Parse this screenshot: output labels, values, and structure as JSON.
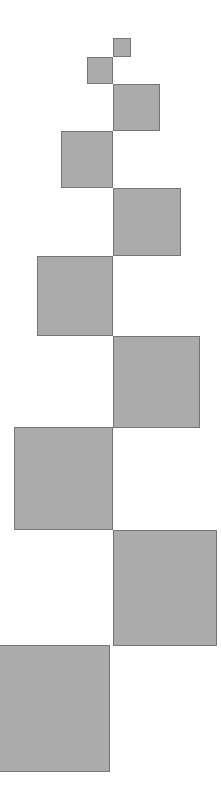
{
  "figure": {
    "canvas_width": 221,
    "canvas_height": 806,
    "background_color": "#ffffff",
    "fill_color": "#ababab",
    "stroke_color": "#757575",
    "stroke_width": 1
  },
  "chart_data": {
    "type": "diagram",
    "xlabel": "",
    "ylabel": "",
    "grid": false,
    "legend": null,
    "xlim": [
      0,
      221
    ],
    "ylim": [
      0,
      806
    ],
    "units": "pixels",
    "fill_color": "#ababab",
    "stroke_color": "#757575",
    "squares": [
      {
        "index": 1,
        "side": 18,
        "x": 113,
        "y": 38,
        "width": 18,
        "height": 19,
        "side_label": "1",
        "align": "right",
        "clipped": false
      },
      {
        "index": 2,
        "side": 27,
        "x": 87,
        "y": 57,
        "width": 26,
        "height": 27,
        "side_label": "2",
        "align": "left",
        "clipped": false
      },
      {
        "index": 3,
        "side": 46,
        "x": 113,
        "y": 84,
        "width": 47,
        "height": 47,
        "side_label": "3",
        "align": "right",
        "clipped": false
      },
      {
        "index": 4,
        "side": 52,
        "x": 61,
        "y": 131,
        "width": 52,
        "height": 57,
        "side_label": "4",
        "align": "left",
        "clipped": false
      },
      {
        "index": 5,
        "side": 68,
        "x": 113,
        "y": 188,
        "width": 68,
        "height": 68,
        "side_label": "5",
        "align": "right",
        "clipped": false
      },
      {
        "index": 6,
        "side": 80,
        "x": 37,
        "y": 256,
        "width": 76,
        "height": 80,
        "side_label": "6",
        "align": "left",
        "clipped": false
      },
      {
        "index": 7,
        "side": 92,
        "x": 113,
        "y": 336,
        "width": 87,
        "height": 92,
        "side_label": "7",
        "align": "right",
        "clipped": false
      },
      {
        "index": 8,
        "side": 102,
        "x": 14,
        "y": 427,
        "width": 99,
        "height": 103,
        "side_label": "8",
        "align": "left",
        "clipped": false
      },
      {
        "index": 9,
        "side": 116,
        "x": 113,
        "y": 530,
        "width": 104,
        "height": 116,
        "side_label": "9",
        "align": "right",
        "clipped": true
      },
      {
        "index": 10,
        "side": 127,
        "x": -18,
        "y": 645,
        "width": 128,
        "height": 127,
        "side_label": "10",
        "align": "left",
        "clipped": true
      }
    ]
  }
}
